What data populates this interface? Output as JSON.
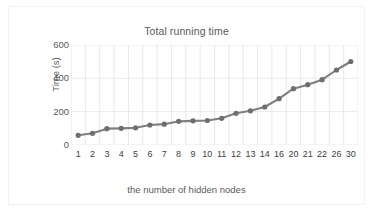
{
  "chart_data": {
    "type": "line",
    "title": "Total running time",
    "xlabel": "the number of hidden nodes",
    "ylabel": "Time (s)",
    "categories": [
      "1",
      "2",
      "3",
      "4",
      "5",
      "6",
      "7",
      "8",
      "9",
      "10",
      "11",
      "12",
      "13",
      "14",
      "16",
      "20",
      "21",
      "22",
      "26",
      "30"
    ],
    "values": [
      58,
      70,
      98,
      100,
      103,
      120,
      125,
      142,
      145,
      147,
      160,
      190,
      205,
      228,
      278,
      338,
      362,
      392,
      450,
      501
    ],
    "series": [
      {
        "name": "Total running time",
        "values": [
          58,
          70,
          98,
          100,
          103,
          120,
          125,
          142,
          145,
          147,
          160,
          190,
          205,
          228,
          278,
          338,
          362,
          392,
          450,
          501
        ]
      }
    ],
    "yticks": [
      0,
      200,
      400,
      600
    ],
    "ytick_labels": [
      "0",
      "200",
      "400",
      "600"
    ],
    "ylim": [
      0,
      600
    ],
    "grid": "vertical-and-horizontal-light",
    "legend": "none",
    "marker": "circle",
    "line_color": "#7f7f7f",
    "marker_color": "#6e6e6e",
    "grid_color": "#e8e8ee",
    "text_color": "#595959",
    "background": "#ffffff"
  }
}
